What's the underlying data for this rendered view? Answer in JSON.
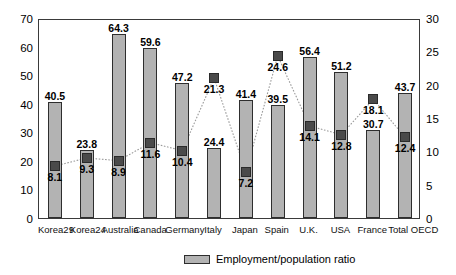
{
  "chart_data": {
    "type": "bar",
    "title": "",
    "subtitle": "",
    "xlabel": "",
    "ylabel": "",
    "categories": [
      "Korea29",
      "Korea24",
      "Australia",
      "Canada",
      "Germany",
      "Italy",
      "Japan",
      "Spain",
      "U.K.",
      "USA",
      "France",
      "Total OECD"
    ],
    "series": [
      {
        "name": "Employment/population ratio",
        "axis": "left",
        "type": "bar",
        "values": [
          40.5,
          23.8,
          64.3,
          59.6,
          47.2,
          24.4,
          41.4,
          39.5,
          56.4,
          51.2,
          30.7,
          43.7
        ]
      },
      {
        "name": "marker-series",
        "axis": "right",
        "type": "scatter",
        "values": [
          8.1,
          9.3,
          8.9,
          11.6,
          10.4,
          21.3,
          7.2,
          24.6,
          14.1,
          12.8,
          18.1,
          12.4
        ]
      }
    ],
    "ylim": [
      0,
      70
    ],
    "yticks": [
      0,
      10,
      20,
      30,
      40,
      50,
      60,
      70
    ],
    "y2lim": [
      0,
      30
    ],
    "y2ticks": [
      0,
      5,
      10,
      15,
      20,
      25,
      30
    ],
    "grid": false,
    "legend": {
      "position": "bottom-center",
      "entries": [
        "Employment/population ratio"
      ]
    },
    "colors": {
      "bar_fill": "#b3b3b3",
      "bar_edge": "#2e2e2e",
      "marker_fill": "#4a4a4a",
      "axis": "#3a3a3a",
      "connector": "#9a9a9a",
      "background": "#ffffff"
    }
  },
  "axis_left": {
    "labels": [
      "70",
      "60",
      "50",
      "40",
      "30",
      "20",
      "10",
      "0"
    ]
  },
  "axis_right": {
    "labels": [
      "30",
      "25",
      "20",
      "15",
      "10",
      "5",
      "0"
    ]
  },
  "legend": {
    "label": "Employment/population ratio"
  }
}
